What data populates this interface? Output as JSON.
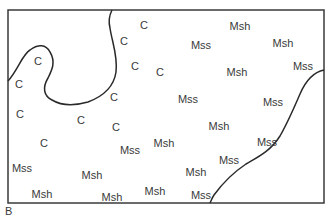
{
  "figure": {
    "label": "B",
    "border": {
      "left": 8,
      "top": 10,
      "right": 324,
      "bottom": 203,
      "color": "#3a3a3a"
    },
    "boundaries": [
      {
        "name": "left-loop-boundary",
        "path": "M8,81 C18,70 22,55 30,50 C38,44 46,44 50,52 C56,62 52,70 48,78 C42,88 44,96 52,100 C62,106 74,106 88,102 C104,96 114,86 116,72 C118,56 112,42 110,28 C108,20 110,14 112,10"
      },
      {
        "name": "right-boundary",
        "path": "M324,70 C314,72 306,80 300,94 C294,108 288,122 280,136 C270,152 256,158 246,164 C234,172 222,184 214,195 C212,198 211,201 210,203"
      }
    ],
    "labels": [
      {
        "text": "C",
        "x": 38,
        "y": 61
      },
      {
        "text": "C",
        "x": 19,
        "y": 84
      },
      {
        "text": "C",
        "x": 20,
        "y": 114
      },
      {
        "text": "C",
        "x": 44,
        "y": 143
      },
      {
        "text": "C",
        "x": 144,
        "y": 25
      },
      {
        "text": "C",
        "x": 124,
        "y": 41
      },
      {
        "text": "C",
        "x": 135,
        "y": 66
      },
      {
        "text": "C",
        "x": 160,
        "y": 72
      },
      {
        "text": "C",
        "x": 114,
        "y": 97
      },
      {
        "text": "C",
        "x": 81,
        "y": 120
      },
      {
        "text": "C",
        "x": 116,
        "y": 127
      },
      {
        "text": "Msh",
        "x": 240,
        "y": 26
      },
      {
        "text": "Mss",
        "x": 201,
        "y": 45
      },
      {
        "text": "Msh",
        "x": 283,
        "y": 43
      },
      {
        "text": "Mss",
        "x": 303,
        "y": 66
      },
      {
        "text": "Msh",
        "x": 237,
        "y": 72
      },
      {
        "text": "Mss",
        "x": 188,
        "y": 99
      },
      {
        "text": "Mss",
        "x": 273,
        "y": 102
      },
      {
        "text": "Msh",
        "x": 219,
        "y": 126
      },
      {
        "text": "Mss",
        "x": 130,
        "y": 150
      },
      {
        "text": "Msh",
        "x": 164,
        "y": 143
      },
      {
        "text": "Mss",
        "x": 267,
        "y": 142
      },
      {
        "text": "Mss",
        "x": 229,
        "y": 160
      },
      {
        "text": "Mss",
        "x": 22,
        "y": 168
      },
      {
        "text": "Msh",
        "x": 92,
        "y": 175
      },
      {
        "text": "Msh",
        "x": 196,
        "y": 172
      },
      {
        "text": "Msh",
        "x": 42,
        "y": 194
      },
      {
        "text": "Msh",
        "x": 112,
        "y": 197
      },
      {
        "text": "Msh",
        "x": 155,
        "y": 191
      },
      {
        "text": "Mss",
        "x": 201,
        "y": 195
      }
    ]
  }
}
